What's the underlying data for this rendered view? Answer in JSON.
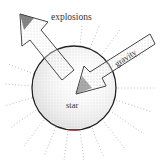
{
  "diagram": {
    "labels": {
      "explosions": "explosions",
      "gravity": "gravity",
      "star": "star"
    },
    "colors": {
      "outline": "#222222",
      "stipple": "#888888",
      "background": "#ffffff",
      "accent": "#cc3333"
    }
  }
}
